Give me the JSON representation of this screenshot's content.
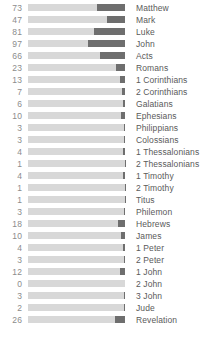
{
  "chart_data": {
    "type": "bar",
    "title": "",
    "subtitle": "",
    "xlabel": "",
    "ylabel": "",
    "orientation": "horizontal",
    "grid": false,
    "legend": null,
    "track_max": 97,
    "xlim": [
      0,
      97
    ],
    "value_label_position": "left",
    "category_label_position": "right",
    "bar_fill_align": "right",
    "colors": {
      "track": "#d8d8d8",
      "fill": "#6e6e6e",
      "value_text": "#8c8c8c",
      "label_text": "#5a5a5a",
      "background": "#ffffff"
    },
    "categories": [
      "Matthew",
      "Mark",
      "Luke",
      "John",
      "Acts",
      "Romans",
      "1 Corinthians",
      "2 Corinthians",
      "Galatians",
      "Ephesians",
      "Philippians",
      "Colossians",
      "1 Thessalonians",
      "2 Thessalonians",
      "1 Timothy",
      "2 Timothy",
      "Titus",
      "Philemon",
      "Hebrews",
      "James",
      "1 Peter",
      "2 Peter",
      "1 John",
      "2 John",
      "3 John",
      "Jude",
      "Revelation"
    ],
    "values": [
      73,
      47,
      81,
      97,
      66,
      23,
      13,
      7,
      6,
      10,
      3,
      3,
      4,
      1,
      4,
      1,
      1,
      3,
      18,
      10,
      4,
      3,
      12,
      0,
      3,
      2,
      26
    ]
  }
}
